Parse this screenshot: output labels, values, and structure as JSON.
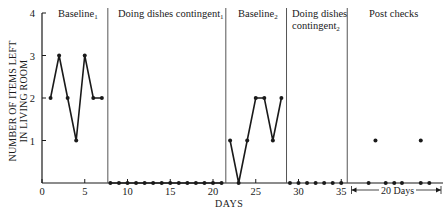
{
  "chart_data": {
    "type": "line",
    "title": "",
    "xlabel": "DAYS",
    "ylabel": "NUMBER OF ITEMS LEFT IN LIVING ROOM",
    "ylabel_lines": [
      "NUMBER OF ITEMS LEFT",
      "IN LIVING ROOM"
    ],
    "xlim": [
      0,
      47
    ],
    "ylim": [
      0,
      4
    ],
    "x_ticks": [
      0,
      5,
      10,
      15,
      20,
      25,
      30,
      35
    ],
    "y_ticks": [
      1,
      2,
      3,
      4
    ],
    "y_tick_labels": [
      "1",
      "2",
      "3",
      "4"
    ],
    "x_tick_labels": [
      "0",
      "5",
      "10",
      "15",
      "20",
      "25",
      "30",
      "35"
    ],
    "grid": false,
    "phases": [
      {
        "name": "Baseline",
        "subscript": "1",
        "start": 0,
        "end": 7.7
      },
      {
        "name": "Doing dishes contingent",
        "subscript": "1",
        "start": 7.7,
        "end": 21.5
      },
      {
        "name": "Baseline",
        "subscript": "2",
        "start": 21.5,
        "end": 28.6
      },
      {
        "name": "Doing dishes contingent",
        "subscript": "2",
        "start": 28.6,
        "end": 35.7
      },
      {
        "name": "Post checks",
        "subscript": "",
        "start": 35.7,
        "end": 47
      }
    ],
    "series": [
      {
        "name": "Baseline1",
        "connected": true,
        "x": [
          1,
          2,
          3,
          4,
          5,
          6,
          7
        ],
        "values": [
          2,
          3,
          2,
          1,
          3,
          2,
          2
        ]
      },
      {
        "name": "Doing dishes contingent1",
        "connected": true,
        "x": [
          8,
          9,
          10,
          11,
          12,
          13,
          14,
          15,
          16,
          17,
          18,
          19,
          20,
          21
        ],
        "values": [
          0,
          0,
          0,
          0,
          0,
          0,
          0,
          0,
          0,
          0,
          0,
          0,
          0,
          0
        ]
      },
      {
        "name": "Baseline2",
        "connected": true,
        "x": [
          22,
          23,
          24,
          25,
          26,
          27,
          28
        ],
        "values": [
          1,
          0,
          1,
          2,
          2,
          1,
          2
        ]
      },
      {
        "name": "Doing dishes contingent2",
        "connected": false,
        "x": [
          29,
          30,
          31,
          32,
          33,
          34,
          35
        ],
        "values": [
          0,
          0,
          0,
          0,
          0,
          0,
          0
        ]
      },
      {
        "name": "Post checks",
        "connected": false,
        "x": [
          38.2,
          39,
          40.2,
          41.2,
          42.1,
          44.3,
          45.3,
          44.3
        ],
        "values": [
          0,
          1,
          0,
          0,
          0,
          1,
          0,
          0
        ]
      }
    ],
    "annotations": [
      {
        "text": "20 Days",
        "type": "range-arrow",
        "from": 36.2,
        "to": 47
      }
    ]
  },
  "labels": {
    "y_axis": [
      "NUMBER OF ITEMS LEFT",
      "IN LIVING ROOM"
    ],
    "x_axis": "DAYS",
    "phase1": "Baseline",
    "phase1_sub": "1",
    "phase2": "Doing dishes contingent",
    "phase2_sub": "1",
    "phase3": "Baseline",
    "phase3_sub": "2",
    "phase4_line1": "Doing dishes",
    "phase4_line2": "contingent",
    "phase4_sub": "2",
    "phase5": "Post checks",
    "range": "20 Days"
  }
}
